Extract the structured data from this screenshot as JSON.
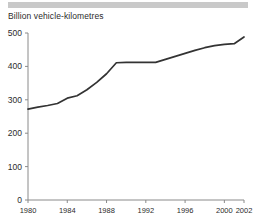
{
  "header": {
    "bar_color": "#c9c9c9"
  },
  "chart_data": {
    "type": "line",
    "title": "Billion vehicle-kilometres",
    "xlabel": "",
    "ylabel": "Billion vehicle-kilometres",
    "xlim": [
      1980,
      2002
    ],
    "ylim": [
      0,
      500
    ],
    "grid": false,
    "legend": null,
    "line_color": "#333333",
    "axis_color": "#8a8a8a",
    "ytick_labels": [
      "0",
      "100",
      "200",
      "300",
      "400",
      "500"
    ],
    "ytick_values": [
      0,
      100,
      200,
      300,
      400,
      500
    ],
    "xtick_labels": [
      "1980",
      "1984",
      "1988",
      "1992",
      "1996",
      "2000",
      "2002"
    ],
    "xtick_values": [
      1980,
      1984,
      1988,
      1992,
      1996,
      2000,
      2002
    ],
    "x": [
      1980,
      1981,
      1982,
      1983,
      1984,
      1985,
      1986,
      1987,
      1988,
      1989,
      1990,
      1991,
      1992,
      1993,
      1994,
      1995,
      1996,
      1997,
      1998,
      1999,
      2000,
      2001,
      2002
    ],
    "values": [
      272,
      278,
      283,
      289,
      305,
      312,
      330,
      352,
      378,
      411,
      412,
      412,
      412,
      412,
      421,
      430,
      439,
      448,
      456,
      462,
      466,
      468,
      488
    ],
    "series": [
      {
        "name": "Road traffic",
        "values": [
          272,
          278,
          283,
          289,
          305,
          312,
          330,
          352,
          378,
          411,
          412,
          412,
          412,
          412,
          421,
          430,
          439,
          448,
          456,
          462,
          466,
          468,
          488
        ]
      }
    ]
  }
}
